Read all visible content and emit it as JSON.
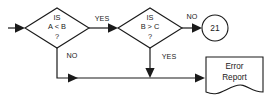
{
  "diagram": {
    "type": "flowchart",
    "background_color": "#ffffff",
    "line_color": "#1a1a1a",
    "shape_fill": "#ffffff",
    "nodes": [
      {
        "id": "start-arrow",
        "shape": "arrow",
        "name": "entry-arrow",
        "label": ""
      },
      {
        "id": "decision-1",
        "shape": "diamond",
        "name": "decision-a-less-than-b",
        "line1": "IS",
        "line2": "A < B",
        "line3": "?"
      },
      {
        "id": "decision-2",
        "shape": "diamond",
        "name": "decision-b-greater-than-c",
        "line1": "IS",
        "line2": "B > C",
        "line3": "?"
      },
      {
        "id": "connector-circle",
        "shape": "circle",
        "name": "connector-21",
        "label": "21"
      },
      {
        "id": "document-1",
        "shape": "document",
        "name": "error-report-document",
        "line1": "Error",
        "line2": "Report"
      }
    ],
    "edges": [
      {
        "id": "edge-entry",
        "from": "start",
        "to": "decision-1",
        "label": ""
      },
      {
        "id": "edge-d1-yes",
        "from": "decision-1",
        "to": "decision-2",
        "label": "YES"
      },
      {
        "id": "edge-d1-no",
        "from": "decision-1",
        "to": "document-1",
        "label": "NO"
      },
      {
        "id": "edge-d2-no",
        "from": "decision-2",
        "to": "connector-circle",
        "label": "NO"
      },
      {
        "id": "edge-d2-yes",
        "from": "decision-2",
        "to": "document-1",
        "label": "YES"
      }
    ]
  }
}
